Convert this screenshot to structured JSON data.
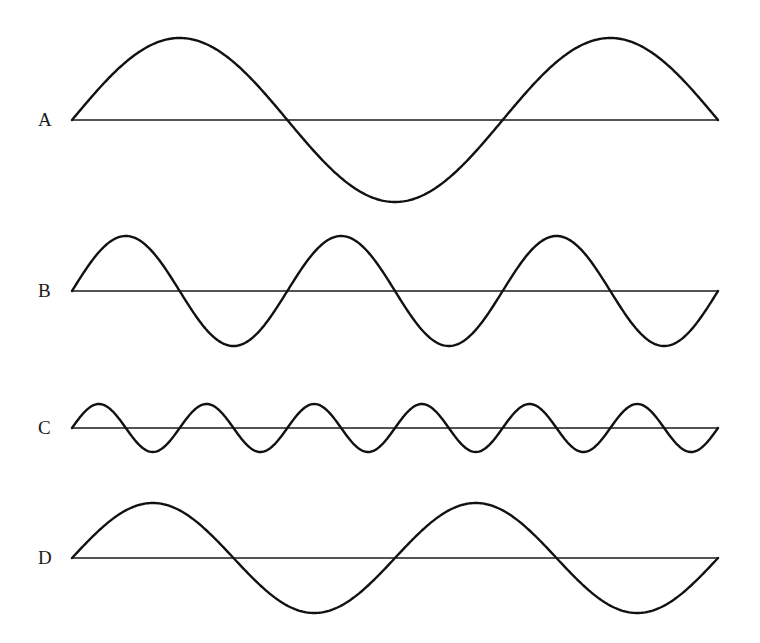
{
  "figure": {
    "x_start": 72,
    "x_end": 718,
    "line_color": "#111111",
    "background": "#ffffff"
  },
  "waves": [
    {
      "label": "A",
      "baseline_y": 120,
      "amplitude": 82,
      "cycles": 1.5
    },
    {
      "label": "B",
      "baseline_y": 291,
      "amplitude": 55,
      "cycles": 3
    },
    {
      "label": "C",
      "baseline_y": 428,
      "amplitude": 24,
      "cycles": 6
    },
    {
      "label": "D",
      "baseline_y": 558,
      "amplitude": 55,
      "cycles": 2
    }
  ],
  "chart_data": {
    "type": "line",
    "title": "",
    "xlabel": "",
    "ylabel": "",
    "grid": false,
    "legend": "none",
    "series": [
      {
        "name": "A",
        "function": "sine",
        "relative_amplitude": 1.5,
        "cycles_in_width": 1.5
      },
      {
        "name": "B",
        "function": "sine",
        "relative_amplitude": 1.0,
        "cycles_in_width": 3
      },
      {
        "name": "C",
        "function": "sine",
        "relative_amplitude": 0.45,
        "cycles_in_width": 6
      },
      {
        "name": "D",
        "function": "sine",
        "relative_amplitude": 1.0,
        "cycles_in_width": 2
      }
    ]
  }
}
